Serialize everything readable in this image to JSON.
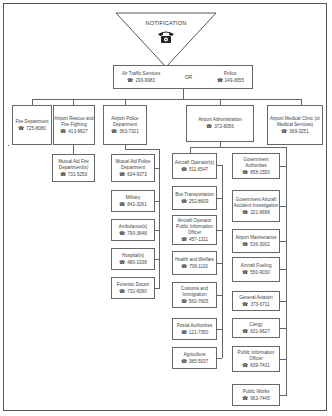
{
  "header": {
    "title": "NOTIFICATION",
    "icon": "telephone-icon"
  },
  "top": {
    "left": {
      "label": "Air Traffic Services",
      "phone": "293-9983"
    },
    "connector": "OR",
    "right": {
      "label": "Police",
      "phone": "149-3655"
    }
  },
  "level1": [
    {
      "label": "Fire Department",
      "phone": "725-8080"
    },
    {
      "label": "Airport Rescue and Fire Fighting",
      "phone": "413-9627"
    },
    {
      "label": "Airport Police Department",
      "phone": "363-7321"
    },
    {
      "label": "Airport Administration",
      "phone": "372-8056"
    },
    {
      "label": "Airport Medical Clinic (or Medical Services)",
      "phone": "369-3251"
    }
  ],
  "rescue_children": [
    {
      "label": "Mutual Aid Fire Department(s)",
      "phone": "731-5250"
    }
  ],
  "police_children": [
    {
      "label": "Mutual Aid Police Department",
      "phone": "634-9373"
    },
    {
      "label": "Military",
      "phone": "842-3261"
    },
    {
      "label": "Ambulance(s)",
      "phone": "790-3648"
    },
    {
      "label": "Hospital(s)",
      "phone": "480-1038"
    },
    {
      "label": "Forensic Doctor",
      "phone": "732-6090"
    }
  ],
  "admin_left": [
    {
      "label": "Aircraft Operator(s)",
      "phone": "511-6547"
    },
    {
      "label": "Bus Transportation",
      "phone": "252-8609"
    },
    {
      "label": "Aircraft Operator Public Information Officer",
      "phone": "457-1311"
    },
    {
      "label": "Health and Welfare",
      "phone": "709-1110"
    },
    {
      "label": "Customs and Immigration",
      "phone": "560-7605"
    },
    {
      "label": "Postal Authorities",
      "phone": "121-7350"
    },
    {
      "label": "Agriculture",
      "phone": "385-5037"
    }
  ],
  "admin_right": [
    {
      "label": "Government Authorities",
      "phone": "858-1550"
    },
    {
      "label": "Government Aircraft Accident Investigation",
      "phone": "321-9698"
    },
    {
      "label": "Airport Maintenance",
      "phone": "536-3002"
    },
    {
      "label": "Aircraft Fueling",
      "phone": "550-9030"
    },
    {
      "label": "General Aviation",
      "phone": "373-6711"
    },
    {
      "label": "Clergy",
      "phone": "631-9627"
    },
    {
      "label": "Public Information Officer",
      "phone": "839-7431"
    },
    {
      "label": "Public Works",
      "phone": "963-7445"
    }
  ],
  "phone_symbol": "☎"
}
